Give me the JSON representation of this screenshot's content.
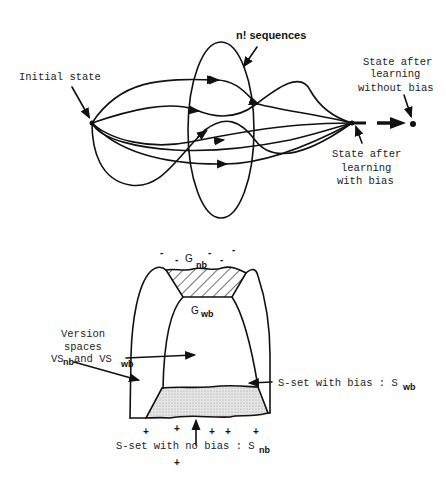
{
  "figure": {
    "top": {
      "title": "Learning paths from initial state",
      "labels": {
        "initial_state": "Initial state",
        "sequences": "n! sequences",
        "without_bias_line1": "State after",
        "without_bias_line2": "learning",
        "without_bias_line3": "without bias",
        "with_bias_line1": "State after",
        "with_bias_line2": "learning",
        "with_bias_line3": "with bias"
      }
    },
    "bottom": {
      "title": "Version spaces with and without bias",
      "labels": {
        "minus_signs": [
          "-",
          "-",
          "-",
          "-",
          "-"
        ],
        "g_nb": "G",
        "g_nb_sub": "nb",
        "g_wb": "G",
        "g_wb_sub": "wb",
        "vs_line1": "Version",
        "vs_line2": "spaces",
        "vs_prefix": "VS",
        "vs_sub1": "nb",
        "vs_and": " and VS",
        "vs_sub2": "wb",
        "s_wb_text": "S-set with bias : S",
        "s_wb_sub": "wb",
        "s_nb_text": "S-set with no bias : S",
        "s_nb_sub": "nb",
        "plus_signs": [
          "+",
          "+",
          "+",
          "+",
          "+",
          "+"
        ]
      }
    }
  }
}
